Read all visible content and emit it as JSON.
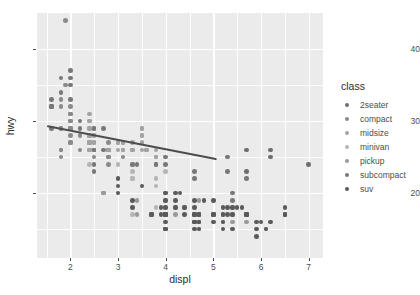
{
  "chart_data": {
    "type": "scatter",
    "title": "",
    "xlabel": "displ",
    "ylabel": "hwy",
    "xlim": [
      1.3,
      7.3
    ],
    "ylim": [
      11,
      45
    ],
    "xticks": [
      2,
      3,
      4,
      5,
      6,
      7
    ],
    "yticks": [
      20,
      30,
      40
    ],
    "grid": true,
    "legend_position": "right",
    "legend_title": "class",
    "legend_entries": [
      "2seater",
      "compact",
      "midsize",
      "minivan",
      "pickup",
      "subcompact",
      "suv"
    ],
    "colors": {
      "2seater": "#6e6e6e",
      "compact": "#8a8a8a",
      "midsize": "#a3a3a3",
      "minivan": "#b5b5b5",
      "pickup": "#999999",
      "subcompact": "#787878",
      "suv": "#5a5a5a",
      "panel_background": "#ebebeb",
      "grid_line": "#ffffff",
      "trend_line": "#4d4d4d",
      "text": "#4d4d4d",
      "title_text": "#2b2b2b",
      "page_background": "#ffffff"
    },
    "trend": {
      "type": "linear-fit",
      "x_start": 1.52,
      "y_start": 29.4,
      "x_end": 5.08,
      "y_end": 24.8
    },
    "series": [
      {
        "name": "2seater",
        "color": "#6e6e6e",
        "points": [
          [
            5.7,
            26
          ],
          [
            5.7,
            23
          ],
          [
            6.2,
            26
          ],
          [
            6.2,
            25
          ],
          [
            7.0,
            24
          ]
        ]
      },
      {
        "name": "compact",
        "color": "#8a8a8a",
        "points": [
          [
            1.8,
            29
          ],
          [
            1.8,
            29
          ],
          [
            2.0,
            31
          ],
          [
            2.0,
            30
          ],
          [
            2.8,
            26
          ],
          [
            2.8,
            26
          ],
          [
            3.1,
            27
          ],
          [
            1.8,
            26
          ],
          [
            1.8,
            25
          ],
          [
            2.0,
            28
          ],
          [
            2.0,
            27
          ],
          [
            2.8,
            25
          ],
          [
            2.8,
            25
          ],
          [
            3.1,
            25
          ],
          [
            1.8,
            33
          ],
          [
            1.8,
            32
          ],
          [
            2.0,
            32
          ],
          [
            2.0,
            29
          ],
          [
            2.8,
            27
          ],
          [
            2.8,
            26
          ],
          [
            3.1,
            26
          ],
          [
            2.4,
            27
          ],
          [
            2.4,
            26
          ],
          [
            2.5,
            26
          ],
          [
            2.5,
            25
          ],
          [
            1.9,
            35
          ],
          [
            2.0,
            31
          ],
          [
            2.0,
            30
          ],
          [
            2.5,
            29
          ],
          [
            2.5,
            27
          ],
          [
            2.2,
            28
          ],
          [
            2.2,
            26
          ],
          [
            2.4,
            28
          ],
          [
            2.4,
            27
          ],
          [
            3.3,
            26
          ],
          [
            1.9,
            44
          ],
          [
            2.0,
            29
          ],
          [
            2.0,
            29
          ],
          [
            2.5,
            26
          ],
          [
            2.8,
            24
          ],
          [
            3.6,
            26
          ],
          [
            2.5,
            28
          ],
          [
            1.8,
            26
          ],
          [
            2.0,
            27
          ]
        ]
      },
      {
        "name": "midsize",
        "color": "#a3a3a3",
        "points": [
          [
            2.4,
            31
          ],
          [
            2.4,
            30
          ],
          [
            3.1,
            26
          ],
          [
            3.5,
            29
          ],
          [
            2.4,
            27
          ],
          [
            2.4,
            26
          ],
          [
            3.0,
            26
          ],
          [
            3.5,
            28
          ],
          [
            2.4,
            29
          ],
          [
            2.4,
            28
          ],
          [
            3.0,
            27
          ],
          [
            3.8,
            25
          ],
          [
            2.4,
            30
          ],
          [
            2.5,
            29
          ],
          [
            3.3,
            27
          ],
          [
            3.5,
            28
          ],
          [
            2.5,
            27
          ],
          [
            2.5,
            26
          ],
          [
            3.3,
            26
          ],
          [
            3.8,
            26
          ],
          [
            2.4,
            28
          ],
          [
            2.4,
            27
          ],
          [
            3.0,
            27
          ],
          [
            3.5,
            27
          ],
          [
            3.5,
            29
          ],
          [
            2.5,
            28
          ],
          [
            2.8,
            26
          ],
          [
            3.6,
            26
          ],
          [
            2.4,
            26
          ],
          [
            3.1,
            27
          ],
          [
            3.8,
            25
          ],
          [
            2.4,
            29
          ],
          [
            3.5,
            26
          ]
        ]
      },
      {
        "name": "minivan",
        "color": "#b5b5b5",
        "points": [
          [
            2.4,
            24
          ],
          [
            3.0,
            24
          ],
          [
            3.3,
            22
          ],
          [
            3.3,
            22
          ],
          [
            3.3,
            24
          ],
          [
            3.3,
            24
          ],
          [
            3.3,
            17
          ],
          [
            3.8,
            22
          ],
          [
            3.8,
            21
          ],
          [
            4.0,
            23
          ],
          [
            3.3,
            23
          ],
          [
            3.8,
            18
          ]
        ]
      },
      {
        "name": "pickup",
        "color": "#999999",
        "points": [
          [
            2.7,
            20
          ],
          [
            2.7,
            20
          ],
          [
            3.4,
            19
          ],
          [
            3.4,
            17
          ],
          [
            4.0,
            20
          ],
          [
            4.0,
            19
          ],
          [
            4.0,
            17
          ],
          [
            4.7,
            19
          ],
          [
            4.7,
            17
          ],
          [
            4.7,
            17
          ],
          [
            4.7,
            16
          ],
          [
            5.2,
            17
          ],
          [
            5.2,
            17
          ],
          [
            5.7,
            17
          ],
          [
            3.7,
            17
          ],
          [
            3.7,
            17
          ],
          [
            4.0,
            18
          ],
          [
            4.0,
            17
          ],
          [
            4.6,
            17
          ],
          [
            4.6,
            16
          ],
          [
            5.4,
            18
          ],
          [
            5.4,
            17
          ],
          [
            5.4,
            16
          ],
          [
            4.7,
            15
          ],
          [
            4.7,
            16
          ],
          [
            5.2,
            16
          ],
          [
            5.7,
            16
          ],
          [
            6.1,
            15
          ],
          [
            4.0,
            15
          ],
          [
            4.2,
            18
          ],
          [
            4.2,
            17
          ],
          [
            4.4,
            18
          ],
          [
            4.6,
            16
          ]
        ]
      },
      {
        "name": "subcompact",
        "color": "#787878",
        "points": [
          [
            1.6,
            33
          ],
          [
            1.6,
            32
          ],
          [
            1.6,
            32
          ],
          [
            1.6,
            29
          ],
          [
            1.6,
            32
          ],
          [
            1.8,
            34
          ],
          [
            1.8,
            36
          ],
          [
            2.0,
            36
          ],
          [
            2.5,
            29
          ],
          [
            2.5,
            26
          ],
          [
            3.3,
            24
          ],
          [
            2.0,
            33
          ],
          [
            2.0,
            35
          ],
          [
            2.0,
            37
          ],
          [
            2.7,
            29
          ],
          [
            2.7,
            26
          ],
          [
            3.4,
            24
          ],
          [
            2.2,
            30
          ],
          [
            2.2,
            29
          ],
          [
            2.5,
            26
          ],
          [
            3.8,
            24
          ],
          [
            4.0,
            25
          ],
          [
            4.0,
            24
          ],
          [
            4.6,
            22
          ],
          [
            5.4,
            20
          ],
          [
            5.4,
            19
          ],
          [
            3.8,
            24
          ],
          [
            4.6,
            23
          ],
          [
            5.3,
            25
          ],
          [
            5.3,
            23
          ],
          [
            5.7,
            22
          ],
          [
            6.5,
            17
          ],
          [
            2.5,
            23
          ],
          [
            2.5,
            24
          ]
        ]
      },
      {
        "name": "suv",
        "color": "#5a5a5a",
        "points": [
          [
            3.7,
            17
          ],
          [
            3.7,
            17
          ],
          [
            4.0,
            17
          ],
          [
            4.0,
            17
          ],
          [
            4.7,
            17
          ],
          [
            4.7,
            16
          ],
          [
            4.7,
            17
          ],
          [
            5.2,
            16
          ],
          [
            5.7,
            17
          ],
          [
            5.9,
            15
          ],
          [
            4.6,
            17
          ],
          [
            5.4,
            17
          ],
          [
            4.0,
            17
          ],
          [
            4.0,
            17
          ],
          [
            4.6,
            16
          ],
          [
            5.0,
            17
          ],
          [
            4.2,
            18
          ],
          [
            4.4,
            18
          ],
          [
            4.6,
            17
          ],
          [
            5.4,
            18
          ],
          [
            3.0,
            20
          ],
          [
            3.3,
            18
          ],
          [
            4.0,
            18
          ],
          [
            4.0,
            17
          ],
          [
            4.6,
            18
          ],
          [
            5.0,
            17
          ],
          [
            3.0,
            21
          ],
          [
            3.3,
            19
          ],
          [
            4.0,
            19
          ],
          [
            4.7,
            16
          ],
          [
            5.7,
            17
          ],
          [
            6.1,
            15
          ],
          [
            4.0,
            15
          ],
          [
            4.0,
            16
          ],
          [
            4.6,
            16
          ],
          [
            5.0,
            16
          ],
          [
            5.3,
            18
          ],
          [
            5.3,
            17
          ],
          [
            5.7,
            17
          ],
          [
            6.5,
            17
          ],
          [
            4.2,
            19
          ],
          [
            4.4,
            17
          ],
          [
            5.6,
            18
          ],
          [
            3.9,
            18
          ],
          [
            3.9,
            17
          ],
          [
            4.6,
            17
          ],
          [
            4.7,
            17
          ],
          [
            5.0,
            17
          ],
          [
            5.2,
            17
          ],
          [
            5.7,
            17
          ],
          [
            5.9,
            16
          ],
          [
            6.0,
            16
          ],
          [
            6.2,
            16
          ],
          [
            3.0,
            22
          ],
          [
            3.5,
            21
          ],
          [
            4.0,
            20
          ],
          [
            4.2,
            20
          ],
          [
            4.3,
            20
          ],
          [
            4.6,
            19
          ],
          [
            4.8,
            19
          ],
          [
            5.0,
            19
          ],
          [
            5.2,
            18
          ],
          [
            5.5,
            18
          ],
          [
            6.5,
            17
          ],
          [
            6.5,
            18
          ],
          [
            4.7,
            15
          ],
          [
            5.2,
            15
          ],
          [
            5.9,
            14
          ],
          [
            4.0,
            15
          ],
          [
            4.6,
            15
          ],
          [
            5.4,
            15
          ]
        ]
      }
    ]
  }
}
